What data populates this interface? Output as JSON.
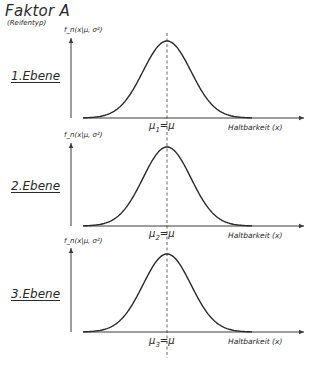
{
  "figure": {
    "title": "Faktor A",
    "subtitle": "(Reifentyp)"
  },
  "chart_data": {
    "type": "line",
    "xlabel": "Haltbarkeit (x)",
    "ylabel": "f_n(x|μ, σ²)",
    "grid": false,
    "legend": null,
    "panels": [
      {
        "label": "1.Ebene",
        "ylabel": "f_n(x|μ, σ²)",
        "xlabel": "Haltbarkeit (x)",
        "mean_label_base": "μ",
        "mean_label_sub": "1",
        "mean_label_rest": "=μ",
        "mean": 0,
        "sd": 1
      },
      {
        "label": "2.Ebene",
        "ylabel": "f_n(x|μ, σ²)",
        "xlabel": "Haltbarkeit (x)",
        "mean_label_base": "μ",
        "mean_label_sub": "2",
        "mean_label_rest": "=μ",
        "mean": 0,
        "sd": 1
      },
      {
        "label": "3.Ebene",
        "ylabel": "f_n(x|μ, σ²)",
        "xlabel": "Haltbarkeit (x)",
        "mean_label_base": "μ",
        "mean_label_sub": "3",
        "mean_label_rest": "=μ",
        "mean": 0,
        "sd": 1
      }
    ]
  },
  "style": {
    "line_color": "#2a2a2a",
    "axis_color": "#3a3a3a",
    "dash_color": "#555555"
  }
}
